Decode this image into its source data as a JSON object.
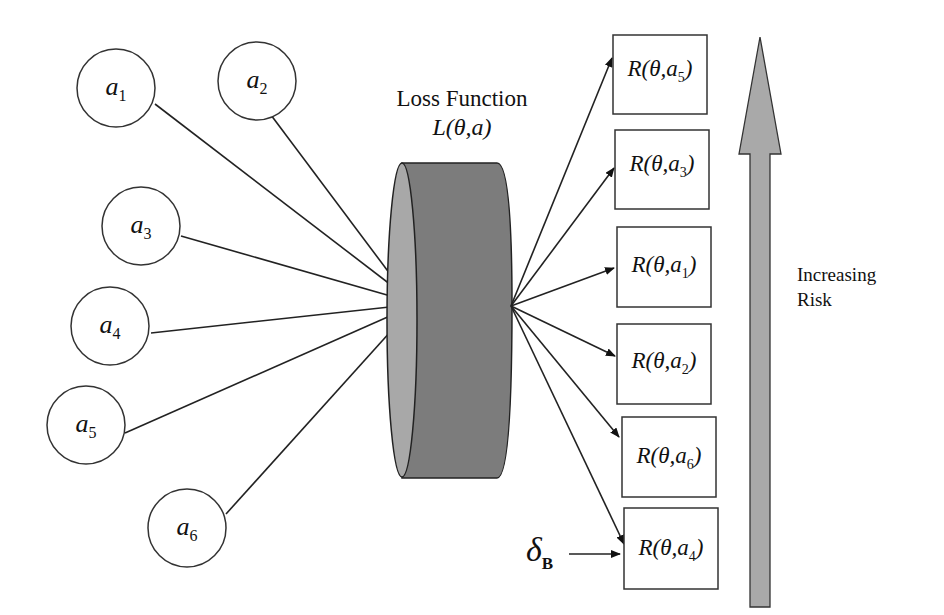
{
  "diagram": {
    "title": "Loss Function",
    "loss_symbol": "L(θ,a)",
    "actions": [
      {
        "id": "a1",
        "base": "a",
        "sub": "1"
      },
      {
        "id": "a2",
        "base": "a",
        "sub": "2"
      },
      {
        "id": "a3",
        "base": "a",
        "sub": "3"
      },
      {
        "id": "a4",
        "base": "a",
        "sub": "4"
      },
      {
        "id": "a5",
        "base": "a",
        "sub": "5"
      },
      {
        "id": "a6",
        "base": "a",
        "sub": "6"
      }
    ],
    "risks": [
      {
        "label_prefix": "R(θ,a",
        "sub": "5",
        "suffix": ")"
      },
      {
        "label_prefix": "R(θ,a",
        "sub": "3",
        "suffix": ")"
      },
      {
        "label_prefix": "R(θ,a",
        "sub": "1",
        "suffix": ")"
      },
      {
        "label_prefix": "R(θ,a",
        "sub": "2",
        "suffix": ")"
      },
      {
        "label_prefix": "R(θ,a",
        "sub": "6",
        "suffix": ")"
      },
      {
        "label_prefix": "R(θ,a",
        "sub": "4",
        "suffix": ")"
      }
    ],
    "bayes_label": {
      "base": "δ",
      "sub": "B"
    },
    "risk_axis": {
      "line1": "Increasing",
      "line2": "Risk"
    },
    "colors": {
      "cylinder_side": "#7a7a7a",
      "cylinder_face": "#a8a8a8",
      "arrow_fill": "#a9a9a9",
      "stroke": "#222222"
    }
  }
}
